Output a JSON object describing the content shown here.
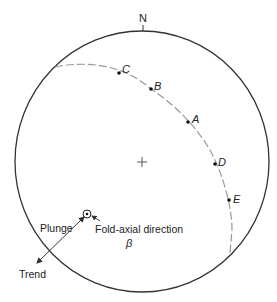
{
  "diagram": {
    "type": "stereonet",
    "north_label": "N",
    "points": [
      {
        "label": "C",
        "x": 119,
        "y": 73,
        "lx": 122,
        "ly": 73
      },
      {
        "label": "B",
        "x": 151,
        "y": 89,
        "lx": 154,
        "ly": 89
      },
      {
        "label": "A",
        "x": 188,
        "y": 122,
        "lx": 191,
        "ly": 122
      },
      {
        "label": "D",
        "x": 215,
        "y": 164,
        "lx": 218,
        "ly": 166
      },
      {
        "label": "E",
        "x": 229,
        "y": 200,
        "lx": 233,
        "ly": 203
      }
    ],
    "labels": {
      "plunge": "Plunge",
      "trend": "Trend",
      "fold_axial": "Fold-axial direction",
      "beta": "β"
    },
    "colors": {
      "circle": "#333333",
      "great_circle": "#999999",
      "text": "#222222"
    }
  }
}
